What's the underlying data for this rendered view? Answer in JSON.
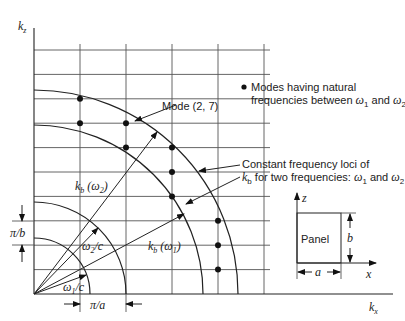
{
  "axes": {
    "vertical_label": "k",
    "vertical_sub": "z",
    "horizontal_label": "k",
    "horizontal_sub": "x"
  },
  "grid": {
    "origin": [
      34,
      294
    ],
    "dx": 46,
    "dy": 24.4,
    "cols": 5,
    "rows": 10
  },
  "arcs": [
    {
      "name": "omega1-over-c",
      "r": 56
    },
    {
      "name": "omega2-over-c",
      "r": 92
    },
    {
      "name": "kb-omega1-locus",
      "r": 169
    },
    {
      "name": "kb-omega2-locus",
      "r": 204
    }
  ],
  "modes": [
    {
      "col": 1,
      "row": 8
    },
    {
      "col": 1,
      "row": 7
    },
    {
      "col": 2,
      "row": 7
    },
    {
      "col": 2,
      "row": 6
    },
    {
      "col": 3,
      "row": 6
    },
    {
      "col": 3,
      "row": 5
    },
    {
      "col": 3,
      "row": 4
    },
    {
      "col": 4,
      "row": 3
    },
    {
      "col": 4,
      "row": 2
    },
    {
      "col": 4,
      "row": 1
    }
  ],
  "labels": {
    "mode_27": "Mode (2, 7)",
    "legend_line1": "Modes having natural",
    "legend_line2_a": "frequencies between ",
    "legend_omega": "ω",
    "legend_sub1": "1",
    "legend_and": " and ",
    "legend_sub2": "2",
    "loci_line1": "Constant frequency loci of",
    "loci_k": "k",
    "loci_b": "b",
    "loci_line2": " for two frequencies: ",
    "kb_omega2_k": "k",
    "kb_omega2_b": "b",
    "kb_omega2_rest": " (ω",
    "kb_omega2_sub": "2",
    "close_paren": ")",
    "kb_omega1_k": "k",
    "kb_omega1_b": "b",
    "kb_omega1_rest": " (ω",
    "kb_omega1_sub": "1",
    "omega2_c": "ω",
    "omega2_c_sub": "2",
    "omega2_c_rest": "/c",
    "omega1_c": "ω",
    "omega1_c_sub": "1",
    "omega1_c_rest": "/c",
    "pi_over_b": "π/b",
    "pi_over_a": "π/a"
  },
  "panel": {
    "title": "Panel",
    "width_label": "a",
    "height_label": "b",
    "x_axis_label": "x",
    "z_axis_label": "z"
  }
}
